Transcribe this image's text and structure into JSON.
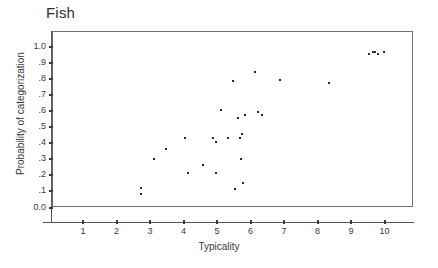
{
  "chart_data": {
    "type": "scatter",
    "title": "Fish",
    "xlabel": "Typicality",
    "ylabel": "Probability of categorization",
    "xlim": [
      0,
      11
    ],
    "ylim": [
      0.0,
      1.05
    ],
    "grid": false,
    "legend": null,
    "x_ticks": [
      1,
      2,
      3,
      4,
      5,
      6,
      7,
      8,
      9,
      10
    ],
    "x_tick_labels": [
      "1",
      "2",
      "3",
      "4",
      "5",
      "6",
      "7",
      "8",
      "9",
      "10"
    ],
    "y_ticks": [
      0.0,
      0.1,
      0.2,
      0.3,
      0.4,
      0.5,
      0.6,
      0.7,
      0.8,
      0.9,
      1.0
    ],
    "y_tick_labels": [
      "0.0",
      ".1",
      ".2",
      ".3",
      ".4",
      ".5",
      ".6",
      ".7",
      ".8",
      ".9",
      "1.0"
    ],
    "marker_color": "#2b2b2b",
    "points": [
      {
        "x": 2.7,
        "y": 0.13
      },
      {
        "x": 2.7,
        "y": 0.09
      },
      {
        "x": 3.1,
        "y": 0.31
      },
      {
        "x": 3.45,
        "y": 0.37
      },
      {
        "x": 4.0,
        "y": 0.44
      },
      {
        "x": 4.1,
        "y": 0.22
      },
      {
        "x": 4.55,
        "y": 0.27
      },
      {
        "x": 4.85,
        "y": 0.44
      },
      {
        "x": 4.95,
        "y": 0.41
      },
      {
        "x": 4.95,
        "y": 0.22
      },
      {
        "x": 5.1,
        "y": 0.61
      },
      {
        "x": 5.3,
        "y": 0.44
      },
      {
        "x": 5.45,
        "y": 0.79
      },
      {
        "x": 5.5,
        "y": 0.12
      },
      {
        "x": 5.6,
        "y": 0.56
      },
      {
        "x": 5.65,
        "y": 0.44
      },
      {
        "x": 5.7,
        "y": 0.31
      },
      {
        "x": 5.72,
        "y": 0.46
      },
      {
        "x": 5.75,
        "y": 0.16
      },
      {
        "x": 5.8,
        "y": 0.58
      },
      {
        "x": 6.1,
        "y": 0.85
      },
      {
        "x": 6.2,
        "y": 0.6
      },
      {
        "x": 6.3,
        "y": 0.58
      },
      {
        "x": 6.85,
        "y": 0.8
      },
      {
        "x": 8.3,
        "y": 0.78
      },
      {
        "x": 9.5,
        "y": 0.96
      },
      {
        "x": 9.62,
        "y": 0.97
      },
      {
        "x": 9.68,
        "y": 0.97
      },
      {
        "x": 9.78,
        "y": 0.96
      },
      {
        "x": 9.95,
        "y": 0.97
      }
    ]
  }
}
